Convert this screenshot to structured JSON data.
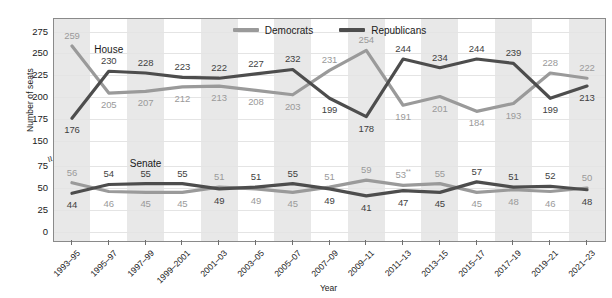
{
  "axes": {
    "ylabel": "Number of seats",
    "xlabel": "Year",
    "yticks": [
      "275",
      "250",
      "225",
      "200",
      "175",
      "150",
      "75",
      "50",
      "25",
      "0"
    ],
    "axis_break_marker": "≈"
  },
  "legend": {
    "position": "top-center",
    "items": [
      {
        "label": "Democrats",
        "color": "#9a9a9a"
      },
      {
        "label": "Republicans",
        "color": "#4d4d4d"
      }
    ]
  },
  "chamber_labels": {
    "house": "House",
    "senate": "Senate"
  },
  "colors": {
    "democrat": "#9a9a9a",
    "republican": "#4d4d4d",
    "band": "#e8e8e8",
    "grid": "#e4e4e4",
    "axis": "#8a8a8a"
  },
  "chart_data": {
    "type": "line",
    "title": "",
    "xlabel": "Year",
    "ylabel": "Number of seats",
    "ylim": [
      0,
      287
    ],
    "grid": true,
    "legend_position": "top-center",
    "categories": [
      "1993–95",
      "1995–97",
      "1997–99",
      "1999–2001",
      "2001–03",
      "2003–05",
      "2005–07",
      "2007–09",
      "2009–11",
      "2011–13",
      "2013–15",
      "2015–17",
      "2017–19",
      "2019–21",
      "2021–23"
    ],
    "series": [
      {
        "name": "Democrats",
        "chamber": "House",
        "color": "#9a9a9a",
        "values": [
          259,
          205,
          207,
          212,
          213,
          208,
          203,
          231,
          254,
          191,
          201,
          184,
          193,
          228,
          222
        ]
      },
      {
        "name": "Republicans",
        "chamber": "House",
        "color": "#4d4d4d",
        "values": [
          176,
          230,
          228,
          223,
          222,
          227,
          232,
          199,
          178,
          244,
          234,
          244,
          239,
          199,
          213
        ]
      },
      {
        "name": "Democrats",
        "chamber": "Senate",
        "color": "#9a9a9a",
        "values": [
          56,
          46,
          45,
          45,
          51,
          49,
          45,
          51,
          59,
          53,
          55,
          45,
          48,
          46,
          50
        ],
        "value_labels": [
          "56",
          "46",
          "45",
          "45",
          "51",
          "49",
          "45",
          "51",
          "59",
          "53**",
          "55",
          "45",
          "48",
          "46",
          "50"
        ]
      },
      {
        "name": "Republicans",
        "chamber": "Senate",
        "color": "#4d4d4d",
        "values": [
          44,
          54,
          55,
          55,
          49,
          51,
          55,
          49,
          41,
          47,
          45,
          57,
          51,
          52,
          48
        ]
      }
    ],
    "annotations": [
      {
        "text": "53**",
        "note": "superscript double asterisk footnote marker on Senate Democrats 2011–13"
      }
    ]
  }
}
